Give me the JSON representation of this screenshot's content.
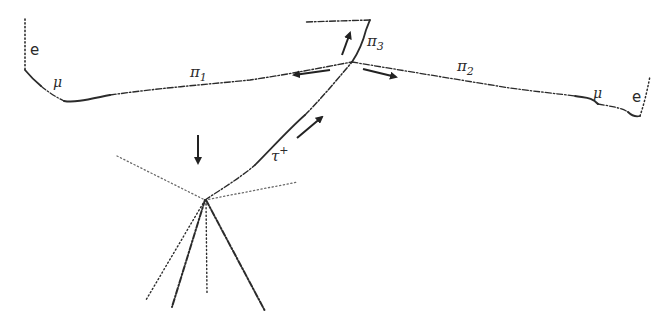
{
  "diagram": {
    "type": "particle-track-event",
    "labels": {
      "e_left": "e",
      "mu_left": "μ",
      "pi1": "π",
      "pi1_sub": "1",
      "pi2": "π",
      "pi2_sub": "2",
      "pi3": "π",
      "pi3_sub": "3",
      "tau": "τ",
      "tau_sup": "+",
      "mu_right": "μ",
      "e_right": "e"
    },
    "nodes": [
      {
        "id": "production-vertex",
        "x": 205,
        "y": 200
      },
      {
        "id": "decay-vertex",
        "x": 352,
        "y": 62
      }
    ],
    "tracks": [
      {
        "id": "tau",
        "from": "production-vertex",
        "to": "decay-vertex",
        "label": "τ+"
      },
      {
        "id": "pi1",
        "from": "decay-vertex",
        "to": "mu-left",
        "label": "π1"
      },
      {
        "id": "pi2",
        "from": "decay-vertex",
        "to": "mu-right",
        "label": "π2"
      },
      {
        "id": "pi3",
        "from": "decay-vertex",
        "to": "top-left",
        "label": "π3"
      },
      {
        "id": "mu-left",
        "label": "μ"
      },
      {
        "id": "e-left",
        "label": "e"
      },
      {
        "id": "mu-right",
        "label": "μ"
      },
      {
        "id": "e-right",
        "label": "e"
      }
    ],
    "arrows": [
      {
        "id": "beam-arrow",
        "direction": "down"
      },
      {
        "id": "tau-arrow",
        "direction": "up-right"
      },
      {
        "id": "pi3-arrow",
        "direction": "up"
      },
      {
        "id": "pi1-arrow",
        "direction": "left"
      },
      {
        "id": "pi2-arrow",
        "direction": "right"
      }
    ]
  }
}
